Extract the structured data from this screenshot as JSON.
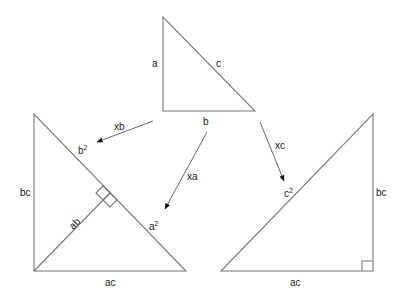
{
  "diagram": {
    "top_triangle": {
      "labels": {
        "left_side": "a",
        "hypotenuse": "c",
        "bottom_side": "b"
      }
    },
    "arrows": [
      {
        "label": "xb",
        "target": "left_triangle"
      },
      {
        "label": "xa",
        "target": "left_triangle"
      },
      {
        "label": "xc",
        "target": "right_triangle"
      }
    ],
    "left_triangle": {
      "labels": {
        "left_side": "bc",
        "bottom_side": "ac",
        "altitude": "ab",
        "upper_hyp_segment_base": "b",
        "upper_hyp_segment_exp": "2",
        "lower_hyp_segment_base": "a",
        "lower_hyp_segment_exp": "2"
      }
    },
    "right_triangle": {
      "labels": {
        "right_side": "bc",
        "bottom_side": "ac",
        "hypotenuse_base": "c",
        "hypotenuse_exp": "2"
      }
    }
  }
}
